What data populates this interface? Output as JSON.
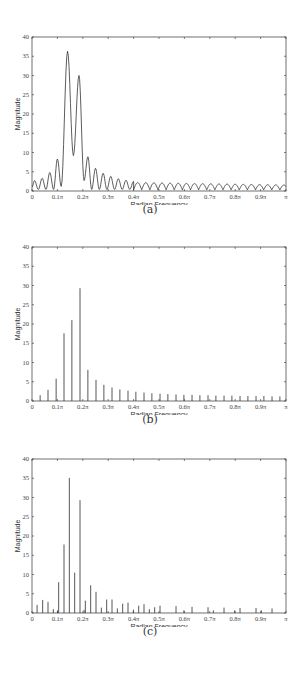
{
  "panels": [
    {
      "caption": "(a)",
      "xlabel": "Radian Frequency",
      "ylabel": "Magnitude"
    },
    {
      "caption": "(b)",
      "xlabel": "Radian Frequency",
      "ylabel": "Magnitude"
    },
    {
      "caption": "(c)",
      "xlabel": "Radian Frequency",
      "ylabel": "Magnitude"
    }
  ],
  "chart_data": [
    {
      "type": "line",
      "title": "(a)",
      "xlabel": "Radian Frequency",
      "ylabel": "Magnitude",
      "xlim": [
        0,
        1
      ],
      "ylim": [
        0,
        40
      ],
      "x_tick_labels": [
        "0",
        "0.1π",
        "0.2π",
        "0.3π",
        "0.4π",
        "0.5π",
        "0.6π",
        "0.7π",
        "0.8π",
        "0.9π",
        "π"
      ],
      "y_tick_labels": [
        "0",
        "5",
        "10",
        "15",
        "20",
        "25",
        "30",
        "35",
        "40"
      ],
      "grid": false,
      "x_units": "fraction of π",
      "lobe_peaks": [
        {
          "x": 0.01,
          "y": 2.7
        },
        {
          "x": 0.04,
          "y": 3.3
        },
        {
          "x": 0.07,
          "y": 4.8
        },
        {
          "x": 0.1,
          "y": 8.3
        },
        {
          "x": 0.14,
          "y": 36.3
        },
        {
          "x": 0.185,
          "y": 30.0
        },
        {
          "x": 0.22,
          "y": 8.9
        },
        {
          "x": 0.25,
          "y": 5.9
        },
        {
          "x": 0.28,
          "y": 4.6
        },
        {
          "x": 0.31,
          "y": 3.8
        },
        {
          "x": 0.34,
          "y": 3.2
        },
        {
          "x": 0.37,
          "y": 2.8
        },
        {
          "x": 0.4,
          "y": 2.5
        },
        {
          "x": 0.45,
          "y": 2.2
        },
        {
          "x": 0.5,
          "y": 2.0
        },
        {
          "x": 0.6,
          "y": 1.7
        },
        {
          "x": 0.7,
          "y": 1.5
        },
        {
          "x": 0.8,
          "y": 1.4
        },
        {
          "x": 0.9,
          "y": 1.3
        },
        {
          "x": 0.99,
          "y": 1.2
        }
      ],
      "notable_minima": [
        {
          "x": 0.115,
          "y": 1.2
        },
        {
          "x": 0.163,
          "y": 9.2
        },
        {
          "x": 0.205,
          "y": 2.7
        }
      ]
    },
    {
      "type": "bar",
      "title": "(b)",
      "xlabel": "Radian Frequency",
      "ylabel": "Magnitude",
      "xlim": [
        0,
        1
      ],
      "ylim": [
        0,
        40
      ],
      "x_tick_labels": [
        "0",
        "0.1π",
        "0.2π",
        "0.3π",
        "0.4π",
        "0.5π",
        "0.6π",
        "0.7π",
        "0.8π",
        "0.9π",
        "π"
      ],
      "y_tick_labels": [
        "0",
        "5",
        "10",
        "15",
        "20",
        "25",
        "30",
        "35",
        "40"
      ],
      "grid": false,
      "stems": [
        {
          "x": 0.032,
          "y": 1.5
        },
        {
          "x": 0.063,
          "y": 2.9
        },
        {
          "x": 0.095,
          "y": 5.8
        },
        {
          "x": 0.126,
          "y": 17.6
        },
        {
          "x": 0.157,
          "y": 21.0
        },
        {
          "x": 0.189,
          "y": 29.3
        },
        {
          "x": 0.22,
          "y": 8.1
        },
        {
          "x": 0.252,
          "y": 5.5
        },
        {
          "x": 0.283,
          "y": 4.2
        },
        {
          "x": 0.315,
          "y": 3.5
        },
        {
          "x": 0.346,
          "y": 3.0
        },
        {
          "x": 0.378,
          "y": 2.7
        },
        {
          "x": 0.409,
          "y": 2.4
        },
        {
          "x": 0.441,
          "y": 2.2
        },
        {
          "x": 0.472,
          "y": 2.0
        },
        {
          "x": 0.504,
          "y": 1.9
        },
        {
          "x": 0.535,
          "y": 1.8
        },
        {
          "x": 0.567,
          "y": 1.7
        },
        {
          "x": 0.598,
          "y": 1.6
        },
        {
          "x": 0.63,
          "y": 1.6
        },
        {
          "x": 0.661,
          "y": 1.5
        },
        {
          "x": 0.693,
          "y": 1.5
        },
        {
          "x": 0.724,
          "y": 1.4
        },
        {
          "x": 0.756,
          "y": 1.4
        },
        {
          "x": 0.787,
          "y": 1.4
        },
        {
          "x": 0.819,
          "y": 1.3
        },
        {
          "x": 0.85,
          "y": 1.3
        },
        {
          "x": 0.882,
          "y": 1.3
        },
        {
          "x": 0.913,
          "y": 1.3
        },
        {
          "x": 0.945,
          "y": 1.2
        },
        {
          "x": 0.976,
          "y": 1.2
        }
      ]
    },
    {
      "type": "bar",
      "title": "(c)",
      "xlabel": "Radian Frequency",
      "ylabel": "Magnitude",
      "xlim": [
        0,
        1
      ],
      "ylim": [
        0,
        40
      ],
      "x_tick_labels": [
        "0",
        "0.1π",
        "0.2π",
        "0.3π",
        "0.4π",
        "0.5π",
        "0.6π",
        "0.7π",
        "0.8π",
        "0.9π",
        "π"
      ],
      "y_tick_labels": [
        "0",
        "5",
        "10",
        "15",
        "20",
        "25",
        "30",
        "35",
        "40"
      ],
      "grid": false,
      "stems": [
        {
          "x": 0.02,
          "y": 2.1
        },
        {
          "x": 0.042,
          "y": 3.4
        },
        {
          "x": 0.063,
          "y": 2.9
        },
        {
          "x": 0.084,
          "y": 1.0
        },
        {
          "x": 0.105,
          "y": 8.0
        },
        {
          "x": 0.101,
          "y": 0.7
        },
        {
          "x": 0.126,
          "y": 17.8
        },
        {
          "x": 0.147,
          "y": 35.1
        },
        {
          "x": 0.168,
          "y": 10.5
        },
        {
          "x": 0.189,
          "y": 29.3
        },
        {
          "x": 0.21,
          "y": 3.2
        },
        {
          "x": 0.205,
          "y": 0.8
        },
        {
          "x": 0.231,
          "y": 7.2
        },
        {
          "x": 0.252,
          "y": 5.5
        },
        {
          "x": 0.273,
          "y": 1.4
        },
        {
          "x": 0.294,
          "y": 3.5
        },
        {
          "x": 0.315,
          "y": 3.5
        },
        {
          "x": 0.336,
          "y": 1.2
        },
        {
          "x": 0.357,
          "y": 2.4
        },
        {
          "x": 0.378,
          "y": 2.7
        },
        {
          "x": 0.399,
          "y": 0.9
        },
        {
          "x": 0.42,
          "y": 1.9
        },
        {
          "x": 0.441,
          "y": 2.3
        },
        {
          "x": 0.462,
          "y": 1.0
        },
        {
          "x": 0.483,
          "y": 1.5
        },
        {
          "x": 0.504,
          "y": 1.9
        },
        {
          "x": 0.567,
          "y": 1.8
        },
        {
          "x": 0.598,
          "y": 0.7
        },
        {
          "x": 0.63,
          "y": 1.6
        },
        {
          "x": 0.693,
          "y": 1.5
        },
        {
          "x": 0.714,
          "y": 0.7
        },
        {
          "x": 0.756,
          "y": 1.4
        },
        {
          "x": 0.798,
          "y": 0.7
        },
        {
          "x": 0.819,
          "y": 1.3
        },
        {
          "x": 0.882,
          "y": 1.3
        },
        {
          "x": 0.903,
          "y": 0.7
        },
        {
          "x": 0.945,
          "y": 1.2
        }
      ]
    }
  ]
}
